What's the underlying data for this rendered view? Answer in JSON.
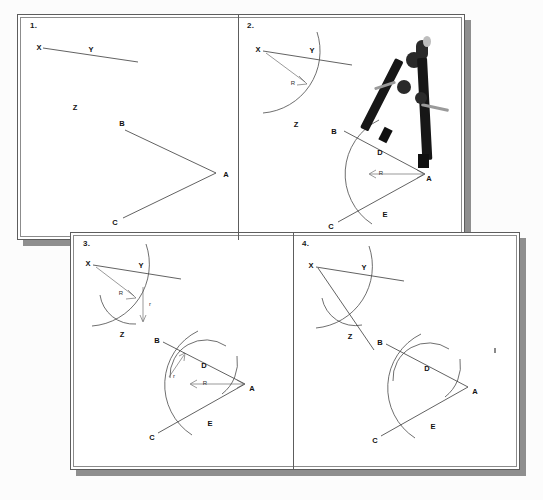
{
  "figure": {
    "background_color": "#fcfcfc",
    "ink_color": "#3a3a3a",
    "panel_border_color": "#5d5d5d",
    "shadow_color": "#8f8f8f"
  },
  "panels": [
    {
      "number": "1.",
      "caption_hidden": "Given ray XY and angle BAC",
      "labels": {
        "x": "X",
        "y": "Y",
        "z": "Z",
        "a": "A",
        "b": "B",
        "c": "C"
      }
    },
    {
      "number": "2.",
      "caption_hidden": "Draw arc of radius R centered at A and at X",
      "labels": {
        "x": "X",
        "y": "Y",
        "z": "Z",
        "a": "A",
        "b": "B",
        "c": "C",
        "d": "D",
        "e": "E",
        "radius_big_top": "R",
        "radius_big_bottom": "R"
      },
      "tool": "compass"
    },
    {
      "number": "3.",
      "caption_hidden": "Measure arc width r between D and E, transfer to Z",
      "labels": {
        "x": "X",
        "y": "Y",
        "z": "Z",
        "a": "A",
        "b": "B",
        "c": "C",
        "d": "D",
        "e": "E",
        "radius_big_top": "R",
        "radius_big_bottom": "R",
        "radius_small_top": "r",
        "radius_small_bottom": "r"
      }
    },
    {
      "number": "4.",
      "caption_hidden": "Draw ray XZ to complete the copied angle",
      "labels": {
        "x": "X",
        "y": "Y",
        "z": "Z",
        "a": "A",
        "b": "B",
        "c": "C",
        "d": "D",
        "e": "E"
      }
    }
  ]
}
